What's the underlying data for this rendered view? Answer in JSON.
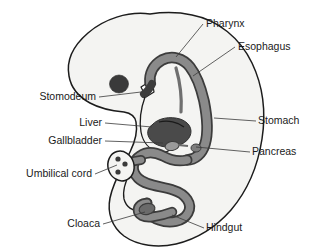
{
  "figure": {
    "background_color": "#ffffff",
    "body_fill": "#f4f4f2",
    "body_stroke": "#1c1c1c",
    "gut_fill": "#8a8a8a",
    "gut_stroke": "#3c3c3c",
    "organ_dark_fill": "#4a4a4a",
    "eye_fill": "#3a3a3a",
    "label_color": "#1a1a1a",
    "leader_color": "#3a3a3a"
  },
  "labels": [
    {
      "id": "pharynx",
      "text": "Pharynx",
      "anchor": "start",
      "x": 206,
      "y": 27,
      "leader": "M 203 24 L 176 57",
      "points_to": "pharynx-tube"
    },
    {
      "id": "esophagus",
      "text": "Esophagus",
      "anchor": "start",
      "x": 238,
      "y": 50,
      "leader": "M 235 47 L 193 76",
      "points_to": "esophagus-tube"
    },
    {
      "id": "stomach",
      "text": "Stomach",
      "anchor": "start",
      "x": 258,
      "y": 124,
      "leader": "M 256 121 L 214 118",
      "points_to": "stomach-region"
    },
    {
      "id": "pancreas",
      "text": "Pancreas",
      "anchor": "start",
      "x": 252,
      "y": 155,
      "leader": "M 250 152 L 196 147",
      "points_to": "pancreas-bud"
    },
    {
      "id": "hindgut",
      "text": "Hindgut",
      "anchor": "start",
      "x": 206,
      "y": 231,
      "leader": "M 204 228 L 172 215",
      "points_to": "hindgut-loop"
    },
    {
      "id": "stomodeum",
      "text": "Stomodeum",
      "anchor": "end",
      "x": 96,
      "y": 100,
      "leader": "M 99 97 L 141 92",
      "points_to": "stomodeum-notch"
    },
    {
      "id": "liver",
      "text": "Liver",
      "anchor": "end",
      "x": 102,
      "y": 126,
      "leader": "M 105 123 L 152 127",
      "points_to": "liver-mass"
    },
    {
      "id": "gallbladder",
      "text": "Gallbladder",
      "anchor": "end",
      "x": 102,
      "y": 144,
      "leader": "M 105 141 L 163 143",
      "points_to": "gallbladder-body"
    },
    {
      "id": "umbilical-cord",
      "text": "Umbilical cord",
      "anchor": "end",
      "x": 92,
      "y": 177,
      "leader": "M 95 174 L 117 165",
      "points_to": "umbilical-cord-stump"
    },
    {
      "id": "cloaca",
      "text": "Cloaca",
      "anchor": "end",
      "x": 100,
      "y": 227,
      "leader": "M 103 224 L 145 212",
      "points_to": "cloaca-region"
    }
  ],
  "structures": {
    "embryo_body": "embryo-outline",
    "eye": "eye-spot",
    "gut_tube": "gut-tube",
    "liver": "liver-mass",
    "gallbladder": "gallbladder-body",
    "pancreas": "pancreas-bud",
    "umbilical_cord": "umbilical-cord-stump",
    "umbilical_vessels_count": 3
  }
}
